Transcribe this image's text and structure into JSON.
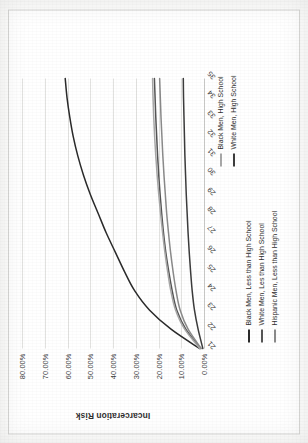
{
  "chart_data": {
    "type": "line",
    "title": "",
    "xlabel": "",
    "ylabel": "Incarceration Risk",
    "x": [
      21,
      22,
      23,
      24,
      25,
      26,
      27,
      28,
      29,
      30,
      31,
      32,
      33,
      34,
      35
    ],
    "xlim": [
      21,
      35
    ],
    "ylim": [
      0,
      80
    ],
    "ytick_labels": [
      "80.00%",
      "70.00%",
      "60.00%",
      "50.00%",
      "40.00%",
      "30.00%",
      "20.00%",
      "10.00%",
      "0.00%"
    ],
    "ytick_values": [
      80,
      70,
      60,
      50,
      40,
      30,
      20,
      10,
      0
    ],
    "xtick_labels": [
      "21",
      "22",
      "23",
      "24",
      "25",
      "26",
      "27",
      "28",
      "29",
      "30",
      "31",
      "32",
      "33",
      "34",
      "35"
    ],
    "grid": true,
    "legend_position": "bottom-and-right",
    "series": [
      {
        "name": "Black Men, Less than High School",
        "color": "#2a2a2a",
        "values": [
          2.0,
          14.5,
          24.0,
          30.5,
          35.0,
          39.0,
          43.0,
          46.5,
          50.0,
          53.0,
          55.5,
          57.5,
          59.0,
          60.2,
          61.0
        ]
      },
      {
        "name": "White Men, Les than High School",
        "color": "#555555",
        "values": [
          1.5,
          8.0,
          12.0,
          14.0,
          15.5,
          16.8,
          17.8,
          18.6,
          19.3,
          19.9,
          20.4,
          20.8,
          21.2,
          21.5,
          21.8
        ]
      },
      {
        "name": "Hispanic Men, Less than High School",
        "color": "#8a8a8a",
        "values": [
          1.2,
          7.0,
          10.5,
          12.3,
          13.6,
          14.7,
          15.6,
          16.4,
          17.0,
          17.6,
          18.1,
          18.5,
          18.9,
          19.2,
          19.5
        ]
      },
      {
        "name": "Black Men, High School",
        "color": "#a8a8a8",
        "values": [
          1.8,
          8.5,
          12.5,
          14.6,
          16.0,
          17.2,
          18.2,
          19.1,
          19.9,
          20.6,
          21.2,
          21.7,
          22.1,
          22.4,
          22.6
        ]
      },
      {
        "name": "White Men, High School",
        "color": "#3c3c3c",
        "values": [
          0.5,
          2.6,
          4.2,
          5.2,
          5.9,
          6.5,
          7.0,
          7.4,
          7.8,
          8.1,
          8.4,
          8.6,
          8.8,
          9.0,
          9.1
        ]
      }
    ]
  },
  "legend_groups": [
    {
      "id": "group-a",
      "items": [
        {
          "label": "Black Men, Less than High School",
          "color": "#2a2a2a"
        },
        {
          "label": "White Men, Les than High School",
          "color": "#555555"
        },
        {
          "label": "Hispanic Men, Less than High School",
          "color": "#8a8a8a"
        }
      ]
    },
    {
      "id": "group-b",
      "items": [
        {
          "label": "Black Men, High School",
          "color": "#a8a8a8"
        },
        {
          "label": "White Men, High School",
          "color": "#3c3c3c"
        }
      ]
    }
  ]
}
